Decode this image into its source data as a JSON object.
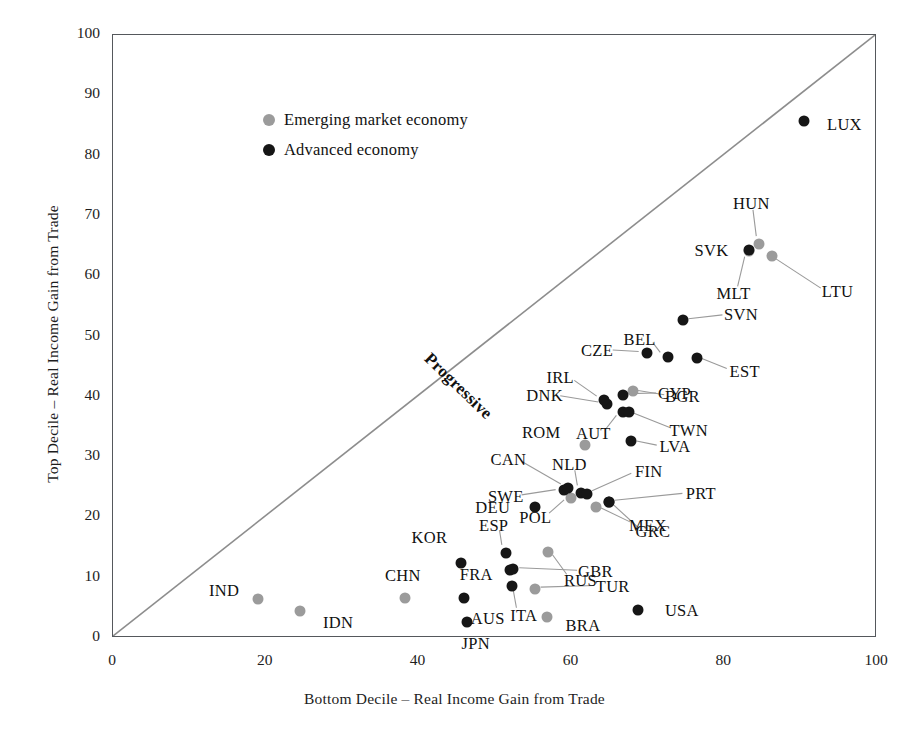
{
  "chart_data": {
    "type": "scatter",
    "title": "",
    "xlabel": "Bottom Decile – Real Income Gain from Trade",
    "ylabel": "Top Decile – Real Income Gain from Trade",
    "xlim": [
      0,
      100
    ],
    "ylim": [
      0,
      100
    ],
    "xticks": [
      0,
      20,
      40,
      60,
      80,
      100
    ],
    "yticks": [
      0,
      10,
      20,
      30,
      40,
      50,
      60,
      70,
      80,
      90,
      100
    ],
    "grid": false,
    "legend_position": "top-left",
    "annotations": [
      {
        "text": "Progressive",
        "type": "diagonal-reference-line-label",
        "angle_deg": 45
      }
    ],
    "reference_line": {
      "type": "45-degree",
      "from": [
        0,
        0
      ],
      "to": [
        100,
        100
      ],
      "color": "#8d8d8d"
    },
    "series": [
      {
        "name": "Emerging market economy",
        "color": "#9b9b9b",
        "points": [
          {
            "label": "IND",
            "x": 19.0,
            "y": 6.5,
            "label_dx": -34,
            "label_dy": -8,
            "leader": false
          },
          {
            "label": "IDN",
            "x": 24.5,
            "y": 4.4,
            "label_dx": 38,
            "label_dy": 12,
            "leader": false
          },
          {
            "label": "CHN",
            "x": 38.2,
            "y": 6.6,
            "label_dx": -2,
            "label_dy": -22,
            "leader": false
          },
          {
            "label": "BRA",
            "x": 56.8,
            "y": 3.5,
            "label_dx": 36,
            "label_dy": 9,
            "leader": false
          },
          {
            "label": "TUR",
            "x": 55.2,
            "y": 8.1,
            "label_dx": 78,
            "label_dy": -2,
            "leader": true
          },
          {
            "label": "RUS",
            "x": 57.0,
            "y": 14.3,
            "label_dx": 32,
            "label_dy": 29,
            "leader": true
          },
          {
            "label": "MEX",
            "x": 63.2,
            "y": 21.7,
            "label_dx": 52,
            "label_dy": 19,
            "leader": true
          },
          {
            "label": "POL",
            "x": 60.0,
            "y": 23.2,
            "label_dx": -36,
            "label_dy": 20,
            "leader": true
          },
          {
            "label": "ROM",
            "x": 61.8,
            "y": 32.0,
            "label_dx": -44,
            "label_dy": -12,
            "leader": false
          },
          {
            "label": "BGR",
            "x": 68.0,
            "y": 41.0,
            "label_dx": 50,
            "label_dy": 6,
            "leader": true
          },
          {
            "label": "HUN",
            "x": 84.6,
            "y": 65.4,
            "label_dx": -8,
            "label_dy": -40,
            "leader": true
          },
          {
            "label": "MLT",
            "x": 83.2,
            "y": 64.2,
            "label_dx": -15,
            "label_dy": 43,
            "leader": true
          },
          {
            "label": "LTU",
            "x": 86.2,
            "y": 63.3,
            "label_dx": 66,
            "label_dy": 36,
            "leader": true
          }
        ]
      },
      {
        "name": "Advanced economy",
        "color": "#161616",
        "points": [
          {
            "label": "JPN",
            "x": 46.3,
            "y": 2.6,
            "label_dx": 9,
            "label_dy": 22,
            "leader": false
          },
          {
            "label": "USA",
            "x": 68.7,
            "y": 4.7,
            "label_dx": 44,
            "label_dy": 1,
            "leader": false
          },
          {
            "label": "AUS",
            "x": 45.9,
            "y": 6.6,
            "label_dx": 24,
            "label_dy": 21,
            "leader": false
          },
          {
            "label": "ITA",
            "x": 52.2,
            "y": 8.6,
            "label_dx": 12,
            "label_dy": 30,
            "leader": true
          },
          {
            "label": "KOR",
            "x": 45.6,
            "y": 12.5,
            "label_dx": -32,
            "label_dy": -25,
            "leader": false
          },
          {
            "label": "FRA",
            "x": 52.0,
            "y": 11.3,
            "label_dx": -34,
            "label_dy": 5,
            "leader": false
          },
          {
            "label": "GBR",
            "x": 52.4,
            "y": 11.4,
            "label_dx": 82,
            "label_dy": 3,
            "leader": true
          },
          {
            "label": "ESP",
            "x": 51.4,
            "y": 14.1,
            "label_dx": -12,
            "label_dy": -27,
            "leader": true
          },
          {
            "label": "DEU",
            "x": 55.2,
            "y": 21.7,
            "label_dx": -42,
            "label_dy": 1,
            "leader": false
          },
          {
            "label": "GRC",
            "x": 64.9,
            "y": 22.5,
            "label_dx": 44,
            "label_dy": 30,
            "leader": true
          },
          {
            "label": "PRT",
            "x": 64.9,
            "y": 22.5,
            "label_dx": 92,
            "label_dy": -8,
            "leader": true
          },
          {
            "label": "SWE",
            "x": 59.0,
            "y": 24.5,
            "label_dx": -58,
            "label_dy": 7,
            "leader": true
          },
          {
            "label": "CAN",
            "x": 59.6,
            "y": 24.8,
            "label_dx": -60,
            "label_dy": -28,
            "leader": true
          },
          {
            "label": "NLD",
            "x": 61.3,
            "y": 24.0,
            "label_dx": -12,
            "label_dy": -28,
            "leader": true
          },
          {
            "label": "FIN",
            "x": 62.0,
            "y": 23.8,
            "label_dx": 62,
            "label_dy": -22,
            "leader": true
          },
          {
            "label": "LVA",
            "x": 67.8,
            "y": 32.6,
            "label_dx": 44,
            "label_dy": 6,
            "leader": true
          },
          {
            "label": "AUT",
            "x": 66.8,
            "y": 37.4,
            "label_dx": -30,
            "label_dy": 22,
            "leader": true
          },
          {
            "label": "TWN",
            "x": 67.5,
            "y": 37.4,
            "label_dx": 60,
            "label_dy": 19,
            "leader": true
          },
          {
            "label": "DNK",
            "x": 64.6,
            "y": 38.8,
            "label_dx": -62,
            "label_dy": -8,
            "leader": true
          },
          {
            "label": "CYP",
            "x": 66.7,
            "y": 40.3,
            "label_dx": 52,
            "label_dy": -1,
            "leader": true
          },
          {
            "label": "IRL",
            "x": 64.3,
            "y": 39.4,
            "label_dx": -44,
            "label_dy": -22,
            "leader": true
          },
          {
            "label": "CZE",
            "x": 69.9,
            "y": 47.3,
            "label_dx": -50,
            "label_dy": -2,
            "leader": true
          },
          {
            "label": "BEL",
            "x": 72.6,
            "y": 46.6,
            "label_dx": -28,
            "label_dy": -17,
            "leader": true
          },
          {
            "label": "EST",
            "x": 76.4,
            "y": 46.5,
            "label_dx": 48,
            "label_dy": 14,
            "leader": true
          },
          {
            "label": "SVN",
            "x": 74.6,
            "y": 52.7,
            "label_dx": 58,
            "label_dy": -5,
            "leader": true
          },
          {
            "label": "SVK",
            "x": 83.3,
            "y": 64.4,
            "label_dx": -38,
            "label_dy": 1,
            "leader": false
          },
          {
            "label": "LUX",
            "x": 90.5,
            "y": 85.8,
            "label_dx": 40,
            "label_dy": 4,
            "leader": false
          }
        ]
      }
    ]
  },
  "legend": {
    "items": [
      {
        "label": "Emerging market economy",
        "color": "#9b9b9b",
        "marker": "circle-grey-icon"
      },
      {
        "label": "Advanced economy",
        "color": "#161616",
        "marker": "circle-black-icon"
      }
    ]
  },
  "axes": {
    "x": {
      "title": "Bottom Decile – Real Income Gain from Trade",
      "tick_labels": [
        "0",
        "20",
        "40",
        "60",
        "80",
        "100"
      ]
    },
    "y": {
      "title": "Top Decile – Real Income Gain from Trade",
      "tick_labels": [
        "0",
        "10",
        "20",
        "30",
        "40",
        "50",
        "60",
        "70",
        "80",
        "90",
        "100"
      ]
    }
  },
  "annotation": {
    "progressive": "Progressive"
  },
  "colors": {
    "advanced": "#161616",
    "emerging": "#9b9b9b",
    "frame": "#55585c",
    "reference_line": "#8d8d8d",
    "leader_line": "#9a9a9a",
    "background": "#ffffff"
  }
}
